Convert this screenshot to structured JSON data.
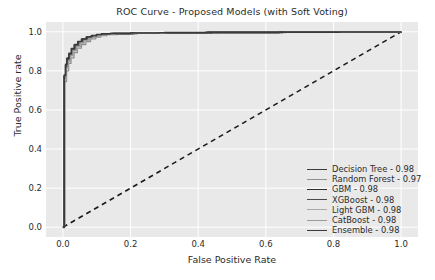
{
  "chart_data": {
    "type": "line",
    "title": "ROC Curve - Proposed Models (with Soft Voting)",
    "xlabel": "False Positive Rate",
    "ylabel": "True Positive rate",
    "xlim": [
      -0.05,
      1.05
    ],
    "ylim": [
      -0.05,
      1.05
    ],
    "xticks": [
      0.0,
      0.2,
      0.4,
      0.6,
      0.8,
      1.0
    ],
    "yticks": [
      0.0,
      0.2,
      0.4,
      0.6,
      0.8,
      1.0
    ],
    "xticklabels": [
      "0.0",
      "0.2",
      "0.4",
      "0.6",
      "0.8",
      "1.0"
    ],
    "yticklabels": [
      "0.0",
      "0.2",
      "0.4",
      "0.6",
      "0.8",
      "1.0"
    ],
    "grid": true,
    "grid_color": "#ffffff",
    "plot_background": "#e9e9e9",
    "figure_background": "#ffffff",
    "legend_position": "lower right",
    "annotations": [
      "dashed diagonal chance line from (0,0) to (1,1)"
    ],
    "reference_line": {
      "name": "chance-line",
      "style": "dashed",
      "color": "#1a1a1a",
      "x": [
        0.0,
        1.0
      ],
      "y": [
        0.0,
        1.0
      ]
    },
    "series": [
      {
        "name": "Decision Tree",
        "auc": 0.98,
        "legend_label": "Decision Tree - 0.98",
        "color": "#3c3c3c",
        "width": 1.5,
        "x": [
          0.0,
          0.004,
          0.008,
          0.012,
          0.018,
          0.026,
          0.034,
          0.044,
          0.056,
          0.07,
          0.086,
          0.1,
          0.115,
          0.14,
          0.2,
          0.28,
          0.42,
          0.64,
          0.82,
          1.0
        ],
        "y": [
          0.0,
          0.775,
          0.83,
          0.862,
          0.888,
          0.912,
          0.932,
          0.948,
          0.962,
          0.972,
          0.98,
          0.985,
          0.988,
          0.991,
          0.993,
          0.995,
          0.996,
          0.998,
          0.999,
          1.0
        ]
      },
      {
        "name": "Random Forest",
        "auc": 0.97,
        "legend_label": "Random Forest - 0.97",
        "color": "#8f8f8f",
        "width": 1.2,
        "x": [
          0.0,
          0.005,
          0.011,
          0.017,
          0.024,
          0.033,
          0.043,
          0.055,
          0.068,
          0.082,
          0.097,
          0.112,
          0.13,
          0.16,
          0.22,
          0.32,
          0.46,
          0.66,
          0.84,
          1.0
        ],
        "y": [
          0.0,
          0.745,
          0.8,
          0.838,
          0.866,
          0.893,
          0.916,
          0.934,
          0.95,
          0.963,
          0.973,
          0.98,
          0.985,
          0.989,
          0.992,
          0.994,
          0.996,
          0.997,
          0.999,
          1.0
        ]
      },
      {
        "name": "GBM",
        "auc": 0.98,
        "legend_label": "GBM - 0.98",
        "color": "#2e2e2e",
        "width": 1.8,
        "x": [
          0.0,
          0.004,
          0.009,
          0.014,
          0.02,
          0.028,
          0.037,
          0.047,
          0.059,
          0.073,
          0.088,
          0.103,
          0.12,
          0.15,
          0.21,
          0.3,
          0.44,
          0.65,
          0.83,
          1.0
        ],
        "y": [
          0.0,
          0.765,
          0.822,
          0.856,
          0.883,
          0.908,
          0.929,
          0.946,
          0.96,
          0.971,
          0.979,
          0.984,
          0.988,
          0.991,
          0.993,
          0.995,
          0.997,
          0.998,
          0.999,
          1.0
        ]
      },
      {
        "name": "XGBoost",
        "auc": 0.98,
        "legend_label": "XGBoost - 0.98",
        "color": "#4a4a4a",
        "width": 1.5,
        "x": [
          0.0,
          0.004,
          0.008,
          0.013,
          0.019,
          0.027,
          0.036,
          0.046,
          0.058,
          0.072,
          0.087,
          0.102,
          0.118,
          0.145,
          0.205,
          0.29,
          0.43,
          0.645,
          0.825,
          1.0
        ],
        "y": [
          0.0,
          0.772,
          0.828,
          0.86,
          0.886,
          0.91,
          0.931,
          0.947,
          0.961,
          0.972,
          0.98,
          0.985,
          0.988,
          0.991,
          0.993,
          0.995,
          0.997,
          0.998,
          0.999,
          1.0
        ]
      },
      {
        "name": "Light GBM",
        "auc": 0.98,
        "legend_label": "Light GBM - 0.98",
        "color": "#a8a8a8",
        "width": 1.1,
        "x": [
          0.0,
          0.005,
          0.01,
          0.016,
          0.023,
          0.031,
          0.041,
          0.052,
          0.065,
          0.079,
          0.094,
          0.109,
          0.126,
          0.155,
          0.215,
          0.305,
          0.45,
          0.655,
          0.835,
          1.0
        ],
        "y": [
          0.0,
          0.755,
          0.812,
          0.848,
          0.876,
          0.902,
          0.924,
          0.942,
          0.957,
          0.969,
          0.978,
          0.983,
          0.987,
          0.99,
          0.993,
          0.995,
          0.996,
          0.998,
          0.999,
          1.0
        ]
      },
      {
        "name": "CatBoost",
        "auc": 0.98,
        "legend_label": "CatBoost - 0.98",
        "color": "#9a9a9a",
        "width": 1.2,
        "x": [
          0.0,
          0.004,
          0.009,
          0.015,
          0.021,
          0.029,
          0.039,
          0.05,
          0.062,
          0.076,
          0.091,
          0.106,
          0.122,
          0.15,
          0.21,
          0.295,
          0.435,
          0.65,
          0.83,
          1.0
        ],
        "y": [
          0.0,
          0.762,
          0.818,
          0.852,
          0.88,
          0.905,
          0.927,
          0.944,
          0.958,
          0.97,
          0.979,
          0.984,
          0.988,
          0.991,
          0.993,
          0.995,
          0.997,
          0.998,
          0.999,
          1.0
        ]
      },
      {
        "name": "Ensemble",
        "auc": 0.98,
        "legend_label": "Ensemble - 0.98",
        "color": "#3a3a3a",
        "width": 1.6,
        "x": [
          0.0,
          0.004,
          0.008,
          0.012,
          0.018,
          0.025,
          0.034,
          0.044,
          0.055,
          0.069,
          0.084,
          0.099,
          0.114,
          0.14,
          0.2,
          0.285,
          0.425,
          0.64,
          0.82,
          1.0
        ],
        "y": [
          0.0,
          0.778,
          0.834,
          0.865,
          0.89,
          0.914,
          0.934,
          0.95,
          0.963,
          0.973,
          0.981,
          0.986,
          0.989,
          0.991,
          0.994,
          0.995,
          0.997,
          0.998,
          0.999,
          1.0
        ]
      }
    ]
  }
}
